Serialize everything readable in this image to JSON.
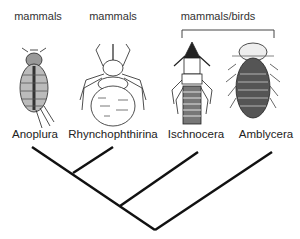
{
  "hosts": [
    {
      "label": "mammals",
      "x": 38,
      "y": 10
    },
    {
      "label": "mammals",
      "x": 113,
      "y": 10
    },
    {
      "label": "mammals/birds",
      "x": 218,
      "y": 10
    }
  ],
  "taxa": [
    {
      "name": "Anoplura",
      "x": 35
    },
    {
      "name": "Rhynchophthirina",
      "x": 113
    },
    {
      "name": "Ischnocera",
      "x": 196
    },
    {
      "name": "Amblycera",
      "x": 266
    }
  ],
  "tree": {
    "root": [
      155,
      230
    ],
    "tips": {
      "Anoplura": [
        32,
        147
      ],
      "Rhynchophthirina": [
        113,
        147
      ],
      "Ischnocera": [
        198,
        152
      ],
      "Amblycera": [
        272,
        152
      ]
    },
    "nodes": {
      "Anoplura+Rhynchophthirina": [
        73,
        172
      ],
      "Anoplura+Rhynchophthirina+Ischnocera": [
        120,
        205
      ]
    }
  }
}
